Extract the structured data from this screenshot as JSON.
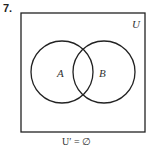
{
  "problem_number": "7.",
  "universal_label": "U",
  "set_a_label": "A",
  "set_b_label": "B",
  "caption": "U′ = ∅"
}
